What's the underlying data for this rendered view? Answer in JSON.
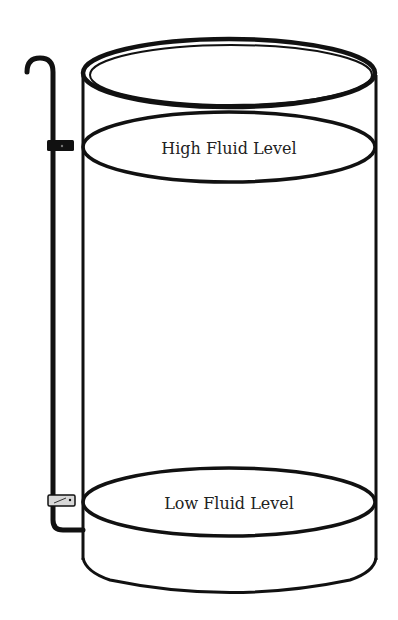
{
  "diagram": {
    "labels": {
      "high": "High Fluid Level",
      "low": "Low Fluid Level"
    },
    "components": [
      "tank",
      "sight-tube",
      "upper-clamp",
      "lower-clamp",
      "high-level-ring",
      "low-level-ring"
    ],
    "colors": {
      "stroke": "#111111",
      "text": "#222222",
      "background": "#ffffff",
      "clamp_lower": "#d8d8d8"
    }
  }
}
